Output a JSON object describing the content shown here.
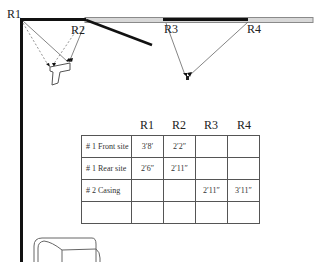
{
  "diagram": {
    "reference_points": [
      {
        "id": "R1",
        "label": "R1"
      },
      {
        "id": "R2",
        "label": "R2"
      },
      {
        "id": "R3",
        "label": "R3"
      },
      {
        "id": "R4",
        "label": "R4"
      }
    ],
    "objects": [
      {
        "name": "handgun",
        "icon": "pistol-icon"
      },
      {
        "name": "casing",
        "icon": "casing-icon"
      },
      {
        "name": "chair",
        "icon": "armchair-icon"
      }
    ],
    "colors": {
      "wall": "#111111",
      "window": "#999999",
      "measure_line": "#666666",
      "table_border": "#555555"
    }
  },
  "table": {
    "columns": [
      "R1",
      "R2",
      "R3",
      "R4"
    ],
    "rows": [
      {
        "label": "# 1 Front site",
        "values": [
          "3′8′",
          "2′2″",
          "",
          ""
        ]
      },
      {
        "label": "# 1 Rear site",
        "values": [
          "2′6″",
          "2′11″",
          "",
          ""
        ]
      },
      {
        "label": "# 2 Casing",
        "values": [
          "",
          "",
          "2′11″",
          "3′11″"
        ]
      },
      {
        "label": "",
        "values": [
          "",
          "",
          "",
          ""
        ]
      }
    ]
  }
}
